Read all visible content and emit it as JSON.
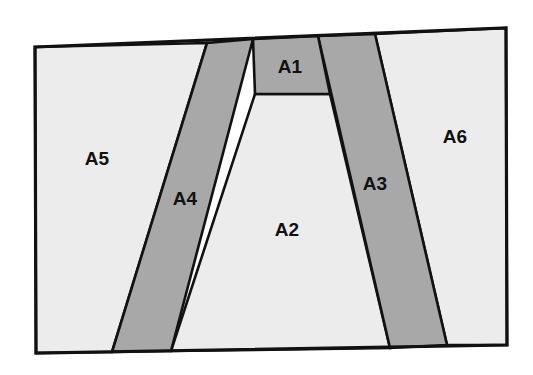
{
  "figure": {
    "canvas": {
      "width": 533,
      "height": 375
    },
    "background_color": "#ffffff",
    "colors": {
      "light_fill": "#ececec",
      "dark_fill": "#a8a8a8",
      "outline": "#111111",
      "label_text": "#111111"
    },
    "outer_frame": {
      "name": "outer-frame",
      "points": "35,47 506,28 507,345 36,353"
    },
    "regions": [
      {
        "id": "A1",
        "label": "A1",
        "fill": "dark",
        "points": "253,39 318,36 330,94 255,94",
        "label_x": 290,
        "label_y": 68
      },
      {
        "id": "A2",
        "label": "A2",
        "fill": "light",
        "points": "255,94 330,94 390,348 171,351",
        "label_x": 287,
        "label_y": 231
      },
      {
        "id": "A3",
        "label": "A3",
        "fill": "dark",
        "points": "318,36 375,34 447,345 390,348",
        "label_x": 375,
        "label_y": 185
      },
      {
        "id": "A4",
        "label": "A4",
        "fill": "dark",
        "points": "207,43 253,39 171,351 112,352",
        "label_x": 185,
        "label_y": 200
      },
      {
        "id": "A5",
        "label": "A5",
        "fill": "light",
        "points": "35,47 207,43 112,352 36,353",
        "label_x": 97,
        "label_y": 160
      },
      {
        "id": "A6",
        "label": "A6",
        "fill": "light",
        "points": "375,34 506,28 507,345 447,345",
        "label_x": 455,
        "label_y": 138
      }
    ]
  }
}
